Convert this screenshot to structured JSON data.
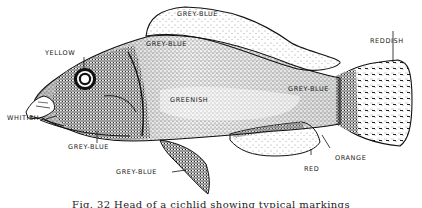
{
  "figure": {
    "caption": "Fig. 32  Head of a cichlid showing typical markings",
    "caption_visible": "partially cut off at bottom edge"
  },
  "labels": [
    {
      "id": "dorsal-fin-upper",
      "text": "GREY-BLUE"
    },
    {
      "id": "back",
      "text": "GREY-BLUE"
    },
    {
      "id": "eye",
      "text": "YELLOW"
    },
    {
      "id": "tail",
      "text": "REDDISH"
    },
    {
      "id": "body",
      "text": "GREENISH"
    },
    {
      "id": "caudal-peduncle",
      "text": "GREY-BLUE"
    },
    {
      "id": "lips",
      "text": "WHITISH"
    },
    {
      "id": "throat",
      "text": "GREY-BLUE"
    },
    {
      "id": "pelvic-fin",
      "text": "GREY-BLUE"
    },
    {
      "id": "anal-fin",
      "text": "RED"
    },
    {
      "id": "anal-fin-edge",
      "text": "ORANGE"
    }
  ],
  "colors": {
    "ink": "#1a1a1a",
    "paper": "#ffffff"
  }
}
